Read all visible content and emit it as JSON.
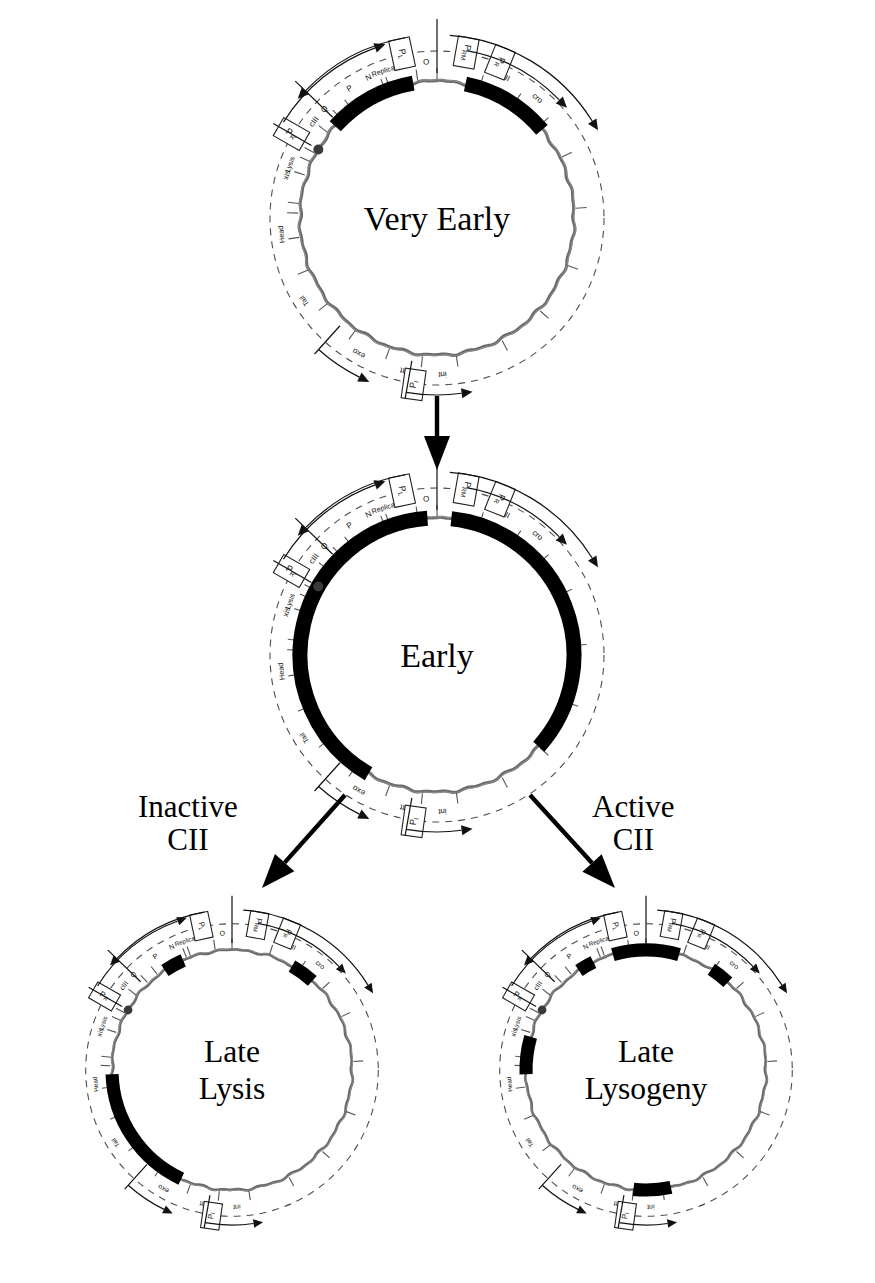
{
  "figure": {
    "type": "diagram",
    "panel_order": [
      "very_early",
      "early",
      "late_lysis",
      "late_lysogeny"
    ]
  },
  "panels": [
    {
      "id": "very_early",
      "title": "Very Early",
      "title_lines": [
        "Very Early"
      ],
      "cx": 437,
      "cy": 218,
      "r": 137,
      "active_arcs": [
        {
          "name": "PL-very-early",
          "start_deg": -48,
          "end_deg": -10,
          "label": "N"
        },
        {
          "name": "PR-very-early",
          "start_deg": 12,
          "end_deg": 50,
          "label": "cro"
        }
      ]
    },
    {
      "id": "early",
      "title": "Early",
      "title_lines": [
        "Early"
      ],
      "cx": 437,
      "cy": 655,
      "r": 137,
      "active_arcs": [
        {
          "name": "PL-early-extended",
          "start_deg": -150,
          "end_deg": -4,
          "label": "N cIII xis int"
        },
        {
          "name": "PR-early-extended",
          "start_deg": 6,
          "end_deg": 132,
          "label": "cro cII O P"
        }
      ]
    },
    {
      "id": "late_lysis",
      "title": "Late Lysis",
      "title_lines": [
        "Late",
        "Lysis"
      ],
      "cx": 232,
      "cy": 1070,
      "r": 120,
      "active_arcs": [
        {
          "name": "N-residual",
          "start_deg": -34,
          "end_deg": -24,
          "label": "N"
        },
        {
          "name": "cro-residual",
          "start_deg": 30,
          "end_deg": 42,
          "label": "cro"
        },
        {
          "name": "late-lytic-operon",
          "start_deg": 205,
          "end_deg": 268,
          "label": "Tail Head Lysis"
        }
      ]
    },
    {
      "id": "late_lysogeny",
      "title": "Late Lysogeny",
      "title_lines": [
        "Late",
        "Lysogeny"
      ],
      "cx": 646,
      "cy": 1070,
      "r": 120,
      "active_arcs": [
        {
          "name": "N-residual",
          "start_deg": -34,
          "end_deg": -26,
          "label": "N"
        },
        {
          "name": "cI-repressor",
          "start_deg": -16,
          "end_deg": 16,
          "label": "cI"
        },
        {
          "name": "cro-residual",
          "start_deg": 33,
          "end_deg": 43,
          "label": "cro"
        },
        {
          "name": "int-from-PI",
          "start_deg": 168,
          "end_deg": 186,
          "label": "int"
        },
        {
          "name": "Q-residual",
          "start_deg": 268,
          "end_deg": 286,
          "label": "Q"
        }
      ]
    }
  ],
  "genes": [
    {
      "name": "int",
      "angle_deg": 178,
      "side": "left"
    },
    {
      "name": "att",
      "angle_deg": 192,
      "side": "left"
    },
    {
      "name": "exo",
      "angle_deg": 210,
      "side": "left"
    },
    {
      "name": "Tail",
      "angle_deg": 238,
      "side": "left"
    },
    {
      "name": "Head",
      "angle_deg": 264,
      "side": "left"
    },
    {
      "name": "Lysis",
      "angle_deg": 290,
      "side": "left"
    },
    {
      "name": "cos",
      "angle_deg": 300,
      "side": "left"
    },
    {
      "name": "S",
      "angle_deg": 297,
      "side": "right"
    },
    {
      "name": "R",
      "angle_deg": 303,
      "side": "right"
    },
    {
      "name": "Q",
      "angle_deg": 314,
      "side": "right"
    },
    {
      "name": "P",
      "angle_deg": 326,
      "side": "right"
    },
    {
      "name": "Replication",
      "angle_deg": 342,
      "side": "right"
    },
    {
      "name": "O",
      "angle_deg": 356,
      "side": "right"
    },
    {
      "name": "cII",
      "angle_deg": 26,
      "side": "right"
    },
    {
      "name": "cro",
      "angle_deg": 40,
      "side": "right"
    },
    {
      "name": "cI",
      "angle_deg": 12,
      "side": "right"
    },
    {
      "name": "N",
      "angle_deg": -26,
      "side": "left"
    },
    {
      "name": "cIII",
      "angle_deg": -52,
      "side": "left"
    },
    {
      "name": "xis",
      "angle_deg": -74,
      "side": "left"
    }
  ],
  "gene_ring_labels": [
    "int",
    "att",
    "exo",
    "Tail",
    "Head",
    "Lysis",
    "S",
    "R",
    "Q",
    "P",
    "Replication",
    "O",
    "cII",
    "cro",
    "cI",
    "N",
    "cIII",
    "xis"
  ],
  "promoters": [
    {
      "name": "PL",
      "label": "P",
      "sub": "L",
      "angle_deg": -12,
      "direction": "leftward"
    },
    {
      "name": "PR",
      "label": "P",
      "sub": "R",
      "angle_deg": 22,
      "direction": "rightward"
    },
    {
      "name": "PRM",
      "label": "P",
      "sub": "RM",
      "angle_deg": 10,
      "direction": "rightward"
    },
    {
      "name": "PR'",
      "label": "P",
      "sub": "R'",
      "angle_deg": 300,
      "direction": "rightward"
    },
    {
      "name": "PI",
      "label": "P",
      "sub": "I",
      "angle_deg": 188,
      "direction": "leftward"
    }
  ],
  "flow": {
    "arrows": [
      {
        "name": "very-early-to-early",
        "kind": "vertical"
      },
      {
        "name": "early-to-late-lysis",
        "kind": "diagonal-left"
      },
      {
        "name": "early-to-late-lysogeny",
        "kind": "diagonal-right"
      }
    ],
    "branch_labels": [
      {
        "name": "inactive-cii-label",
        "text": "Inactive\nCII",
        "x": 138,
        "y": 790
      },
      {
        "name": "active-cii-label",
        "text": "Active\nCII",
        "x": 592,
        "y": 790
      }
    ]
  },
  "colors": {
    "ink": "#000000",
    "ring": "#6b6b6b",
    "dashed": "#4d4d4d",
    "background": "#ffffff"
  }
}
